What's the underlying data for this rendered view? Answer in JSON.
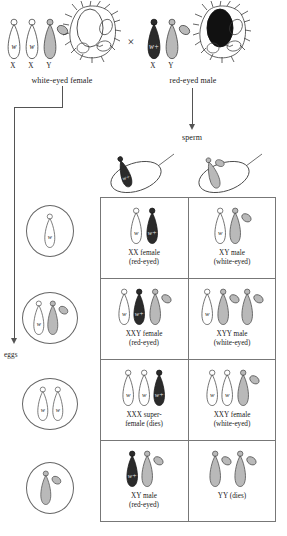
{
  "figure": {
    "cross_symbol": "×"
  },
  "colors": {
    "x_white_fill": "#ffffff",
    "x_red_fill": "#2b2b2b",
    "y_fill": "#b9b9b9",
    "outline": "#4a4a4a",
    "grid_line": "#777777",
    "arrow": "#545454",
    "text": "#1a1a1a"
  },
  "parents": {
    "female": {
      "label": "white-eyed female",
      "chromosome_labels": [
        "X",
        "X",
        "Y"
      ],
      "chromosomes": [
        {
          "type": "X",
          "allele": "w",
          "shade": "white"
        },
        {
          "type": "X",
          "allele": "w",
          "shade": "white"
        },
        {
          "type": "Y",
          "allele": "",
          "shade": "gray"
        }
      ],
      "cell_icon": "ovary-cell-icon"
    },
    "male": {
      "label": "red-eyed male",
      "chromosome_labels": [
        "X",
        "Y"
      ],
      "chromosomes": [
        {
          "type": "X",
          "allele": "w+",
          "shade": "dark"
        },
        {
          "type": "Y",
          "allele": "",
          "shade": "gray"
        }
      ],
      "cell_icon": "testis-cell-icon"
    }
  },
  "gametes": {
    "eggs_label": "eggs",
    "sperm_label": "sperm",
    "sperm": [
      {
        "name": "sperm-x",
        "chromosomes": [
          {
            "type": "X",
            "allele": "w+",
            "shade": "dark"
          }
        ]
      },
      {
        "name": "sperm-y",
        "chromosomes": [
          {
            "type": "Y",
            "allele": "",
            "shade": "gray"
          }
        ]
      }
    ],
    "eggs": [
      {
        "name": "egg-x",
        "chromosomes": [
          {
            "type": "X",
            "allele": "w",
            "shade": "white"
          }
        ]
      },
      {
        "name": "egg-xy",
        "chromosomes": [
          {
            "type": "X",
            "allele": "w",
            "shade": "white"
          },
          {
            "type": "Y",
            "allele": "",
            "shade": "gray"
          }
        ]
      },
      {
        "name": "egg-xx",
        "chromosomes": [
          {
            "type": "X",
            "allele": "w",
            "shade": "white"
          },
          {
            "type": "X",
            "allele": "w",
            "shade": "white"
          }
        ]
      },
      {
        "name": "egg-y",
        "chromosomes": [
          {
            "type": "Y",
            "allele": "",
            "shade": "gray"
          }
        ]
      }
    ]
  },
  "offspring": [
    {
      "id": "r1c1",
      "line1": "XX female",
      "line2": "(red-eyed)",
      "chromosomes": [
        {
          "type": "X",
          "allele": "w",
          "shade": "white"
        },
        {
          "type": "X",
          "allele": "w+",
          "shade": "dark"
        }
      ]
    },
    {
      "id": "r1c2",
      "line1": "XY male",
      "line2": "(white-eyed)",
      "chromosomes": [
        {
          "type": "X",
          "allele": "w",
          "shade": "white"
        },
        {
          "type": "Y",
          "allele": "",
          "shade": "gray"
        }
      ]
    },
    {
      "id": "r2c1",
      "line1": "XXY female",
      "line2": "(red-eyed)",
      "chromosomes": [
        {
          "type": "X",
          "allele": "w",
          "shade": "white"
        },
        {
          "type": "X",
          "allele": "w+",
          "shade": "dark"
        },
        {
          "type": "Y",
          "allele": "",
          "shade": "gray"
        }
      ]
    },
    {
      "id": "r2c2",
      "line1": "XYY male",
      "line2": "(white-eyed)",
      "chromosomes": [
        {
          "type": "X",
          "allele": "w",
          "shade": "white"
        },
        {
          "type": "Y",
          "allele": "",
          "shade": "gray"
        },
        {
          "type": "Y",
          "allele": "",
          "shade": "gray"
        }
      ]
    },
    {
      "id": "r3c1",
      "line1": "XXX super-",
      "line2": "female (dies)",
      "chromosomes": [
        {
          "type": "X",
          "allele": "w",
          "shade": "white"
        },
        {
          "type": "X",
          "allele": "w",
          "shade": "white"
        },
        {
          "type": "X",
          "allele": "w+",
          "shade": "dark"
        }
      ]
    },
    {
      "id": "r3c2",
      "line1": "XXY female",
      "line2": "(white-eyed)",
      "chromosomes": [
        {
          "type": "X",
          "allele": "w",
          "shade": "white"
        },
        {
          "type": "X",
          "allele": "w",
          "shade": "white"
        },
        {
          "type": "Y",
          "allele": "",
          "shade": "gray"
        }
      ]
    },
    {
      "id": "r4c1",
      "line1": "XY male",
      "line2": "(red-eyed)",
      "chromosomes": [
        {
          "type": "X",
          "allele": "w+",
          "shade": "dark"
        },
        {
          "type": "Y",
          "allele": "",
          "shade": "gray"
        }
      ]
    },
    {
      "id": "r4c2",
      "line1": "YY (dies)",
      "line2": "",
      "chromosomes": [
        {
          "type": "Y",
          "allele": "",
          "shade": "gray"
        },
        {
          "type": "Y",
          "allele": "",
          "shade": "gray"
        }
      ]
    }
  ]
}
